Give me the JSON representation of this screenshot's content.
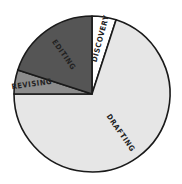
{
  "chart_data": {
    "type": "pie",
    "title": "",
    "start_angle_deg": 0,
    "direction": "clockwise",
    "slices": [
      {
        "label": "DISCOVERY",
        "value": 5,
        "color": "#ffffff"
      },
      {
        "label": "DRAFTING",
        "value": 70,
        "color": "#e6e6e6"
      },
      {
        "label": "REVISING",
        "value": 5,
        "color": "#8c8c8c"
      },
      {
        "label": "EDITING",
        "value": 20,
        "color": "#555555"
      }
    ],
    "legend": "none",
    "labels_inside": true
  }
}
